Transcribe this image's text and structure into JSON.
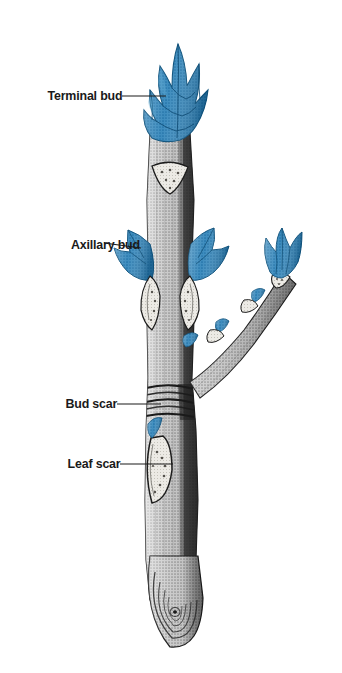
{
  "figure": {
    "background_color": "#ffffff",
    "width": 342,
    "height": 673,
    "colors": {
      "bud_blue": "#2f80b5",
      "bud_blue_dark": "#1d6294",
      "bud_blue_light": "#56a0cd",
      "bark_light": "#d9d9d9",
      "bark_mid": "#a8a8a8",
      "bark_dark": "#3a3a3a",
      "scar_pale": "#e8e6e1",
      "outline": "#1a1a1a",
      "label_text": "#1a1a1a",
      "leader_line": "#1a1a1a"
    }
  },
  "labels": [
    {
      "id": "terminal-bud",
      "text": "Terminal bud",
      "leader": {
        "x1": 122,
        "y1": 96,
        "x2": 166,
        "y2": 96
      }
    },
    {
      "id": "axillary-bud",
      "text": "Axillary bud",
      "leader": {
        "x1": 104,
        "y1": 243,
        "x2": 141,
        "y2": 247
      }
    },
    {
      "id": "bud-scar",
      "text": "Bud scar",
      "leader": {
        "x1": 117,
        "y1": 404,
        "x2": 161,
        "y2": 404
      }
    },
    {
      "id": "leaf-scar",
      "text": "Leaf scar",
      "leader": {
        "x1": 120,
        "y1": 464,
        "x2": 173,
        "y2": 464
      }
    }
  ],
  "parts": [
    {
      "id": "terminal-bud",
      "name": "Terminal bud",
      "color": "#2f80b5",
      "description": "Cone of overlapping pointed blue bud scales at the tip of the main twig"
    },
    {
      "id": "axillary-bud",
      "name": "Axillary bud",
      "color": "#2f80b5",
      "description": "Paired lateral blue buds borne in the axils above the leaf scars"
    },
    {
      "id": "bud-scar",
      "name": "Bud scar",
      "color": "#3a3a3a",
      "description": "Band of encircling ring lines marking the former terminal bud position"
    },
    {
      "id": "leaf-scar",
      "name": "Leaf scar",
      "color": "#e8e6e1",
      "description": "Pale crescent-shaped scar left where a leaf petiole detached"
    },
    {
      "id": "lateral-branch",
      "name": "Lateral branch",
      "color": "#a8a8a8",
      "description": "Side branch angling up to the right ending in its own bud cluster"
    },
    {
      "id": "cut-base",
      "name": "Cut base",
      "color": "#a8a8a8",
      "description": "Rounded cut end of the twig showing concentric growth rings"
    }
  ]
}
